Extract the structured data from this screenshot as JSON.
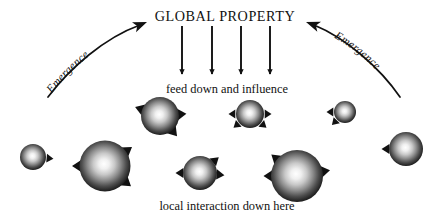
{
  "figure": {
    "background_color": "#ffffff",
    "ink_color": "#111111",
    "width": 445,
    "height": 217
  },
  "labels": {
    "global_property": "GLOBAL PROPERTY",
    "feed_down": "feed down and influence",
    "local_interaction": "local interaction down here",
    "emergence_left": "Emergence",
    "emergence_right": "Emergence"
  },
  "downward_arrows": [
    {
      "name": "down-arrow-1",
      "x": 182,
      "y_start": 26,
      "y_end": 74
    },
    {
      "name": "down-arrow-2",
      "x": 212,
      "y_start": 26,
      "y_end": 74
    },
    {
      "name": "down-arrow-3",
      "x": 241,
      "y_start": 26,
      "y_end": 74
    },
    {
      "name": "down-arrow-4",
      "x": 270,
      "y_start": 26,
      "y_end": 74
    }
  ],
  "emergence_arrows": [
    {
      "name": "emergence-arrow-left",
      "direction": "up-right",
      "path": "M 48 97 C 70 68, 104 38, 140 25",
      "tip_x": 147,
      "tip_y": 22,
      "tip_angle": -22,
      "text_path": "M 46 101 C 68 70, 104 40, 136 27",
      "text_offset": 10
    },
    {
      "name": "emergence-arrow-right",
      "direction": "up-left",
      "path": "M 400 97 C 380 68, 346 38, 314 25",
      "tip_x": 306,
      "tip_y": 22,
      "tip_angle": 200,
      "text_path": "M 318 30 C 350 42, 382 72, 402 101",
      "text_offset": 10
    }
  ],
  "spheres": [
    {
      "name": "sphere-1",
      "cx": 33,
      "cy": 157,
      "r": 13,
      "arrow_angles": [
        5
      ]
    },
    {
      "name": "sphere-2",
      "cx": 105,
      "cy": 166,
      "r": 25.5,
      "arrow_angles": [
        -35,
        180,
        38
      ]
    },
    {
      "name": "sphere-3",
      "cx": 160,
      "cy": 116,
      "r": 19,
      "arrow_angles": [
        -5,
        200,
        50
      ]
    },
    {
      "name": "sphere-4",
      "cx": 200,
      "cy": 173,
      "r": 17,
      "arrow_angles": [
        -40,
        180,
        5
      ]
    },
    {
      "name": "sphere-5",
      "cx": 250,
      "cy": 114,
      "r": 14,
      "arrow_angles": [
        180,
        0,
        140,
        40
      ]
    },
    {
      "name": "sphere-6",
      "cx": 297,
      "cy": 176,
      "r": 26,
      "arrow_angles": [
        -140,
        180,
        -10
      ]
    },
    {
      "name": "sphere-7",
      "cx": 345,
      "cy": 112,
      "r": 11,
      "arrow_angles": [
        180,
        135
      ]
    },
    {
      "name": "sphere-8",
      "cx": 406,
      "cy": 149,
      "r": 17,
      "arrow_angles": [
        180
      ]
    }
  ]
}
